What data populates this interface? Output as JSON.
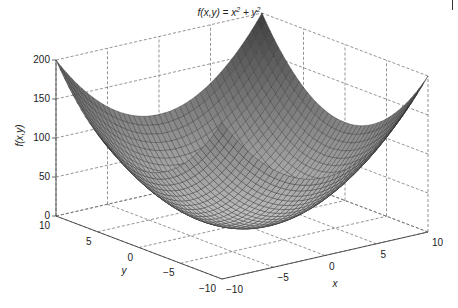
{
  "chart_data": {
    "type": "surface3d",
    "title_parts": {
      "prefix": "f(x,y) = x",
      "exp1": "2",
      "mid": " + y",
      "exp2": "2"
    },
    "function": "x^2 + y^2",
    "xlabel": "x",
    "ylabel": "y",
    "zlabel": "f(x,y)",
    "xlim": [
      -10,
      10
    ],
    "ylim": [
      -10,
      10
    ],
    "zlim": [
      0,
      200
    ],
    "xticks": [
      "−10",
      "−5",
      "0",
      "5",
      "10"
    ],
    "yticks": [
      "10",
      "5",
      "0",
      "−5",
      "−10"
    ],
    "zticks": [
      "0",
      "50",
      "100",
      "150",
      "200"
    ],
    "grid": true,
    "grid_style": "dashed",
    "mesh_resolution": 41,
    "colormap": "grayscale",
    "sample_points": [
      {
        "x": -10,
        "y": -10,
        "z": 200
      },
      {
        "x": -10,
        "y": 10,
        "z": 200
      },
      {
        "x": 10,
        "y": -10,
        "z": 200
      },
      {
        "x": 10,
        "y": 10,
        "z": 200
      },
      {
        "x": 0,
        "y": 0,
        "z": 0
      },
      {
        "x": 10,
        "y": 0,
        "z": 100
      },
      {
        "x": 0,
        "y": 10,
        "z": 100
      },
      {
        "x": -10,
        "y": 0,
        "z": 100
      },
      {
        "x": 0,
        "y": -10,
        "z": 100
      },
      {
        "x": 5,
        "y": 5,
        "z": 50
      }
    ]
  }
}
